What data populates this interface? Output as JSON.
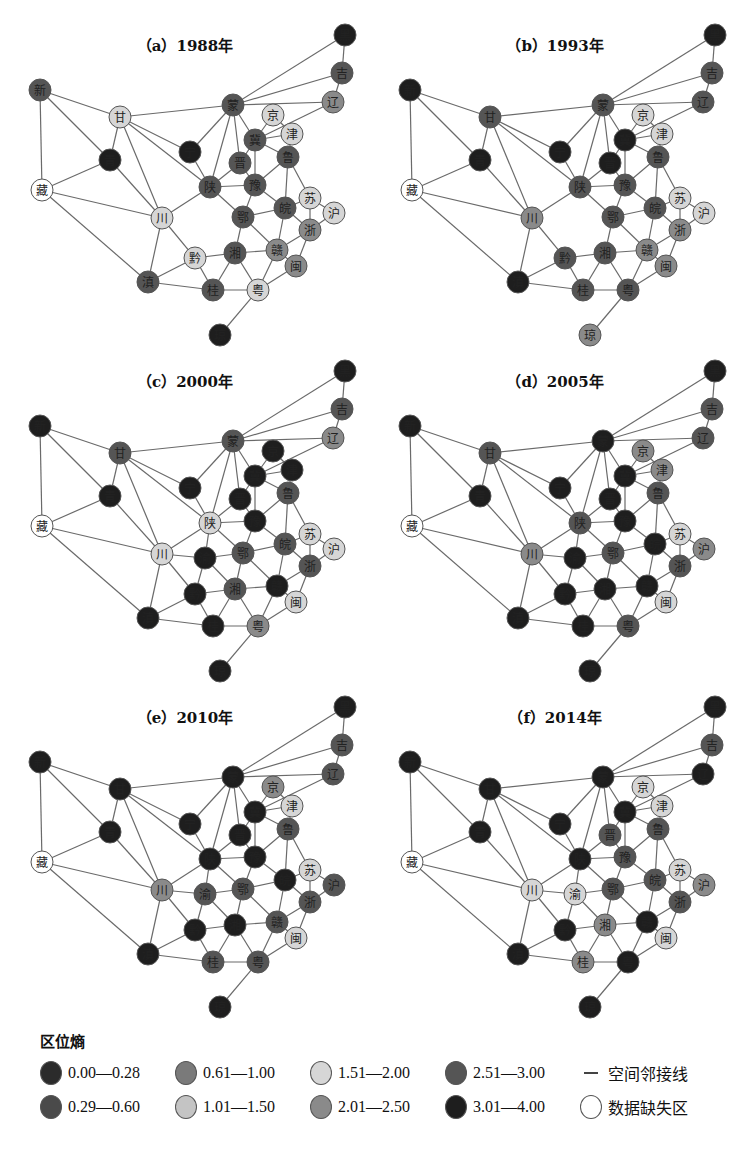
{
  "figure": {
    "panels": [
      {
        "id": "a",
        "title": "（a）1988年",
        "dx": 0,
        "dy": 0
      },
      {
        "id": "b",
        "title": "（b）1993年",
        "dx": 370,
        "dy": 0
      },
      {
        "id": "c",
        "title": "（c）2000年",
        "dx": 0,
        "dy": 336
      },
      {
        "id": "d",
        "title": "（d）2005年",
        "dx": 370,
        "dy": 336
      },
      {
        "id": "e",
        "title": "（e）2010年",
        "dx": 0,
        "dy": 672
      },
      {
        "id": "f",
        "title": "（f）2014年",
        "dx": 370,
        "dy": 672
      }
    ]
  },
  "chart_data": {
    "type": "network-small-multiples",
    "legend_title": "区位熵",
    "classes": [
      {
        "key": "c1",
        "label": "0.00—0.28",
        "color": "#2b2b2b"
      },
      {
        "key": "c2",
        "label": "0.29—0.60",
        "color": "#4a4a4a"
      },
      {
        "key": "c3",
        "label": "0.61—1.00",
        "color": "#7a7a7a"
      },
      {
        "key": "c4",
        "label": "1.01—1.50",
        "color": "#c4c4c4"
      },
      {
        "key": "c5",
        "label": "1.51—2.00",
        "color": "#d6d6d6"
      },
      {
        "key": "c6",
        "label": "2.01—2.50",
        "color": "#8a8a8a"
      },
      {
        "key": "c7",
        "label": "2.51—3.00",
        "color": "#555555"
      },
      {
        "key": "c8",
        "label": "3.01—4.00",
        "color": "#1e1e1e"
      },
      {
        "key": "na",
        "label": "数据缺失区",
        "color": "#ffffff"
      }
    ],
    "edge_legend": "空间邻接线",
    "nodes": {
      "黑": [
        345,
        35
      ],
      "吉": [
        342,
        73
      ],
      "辽": [
        333,
        102
      ],
      "新": [
        40,
        90
      ],
      "甘": [
        120,
        117
      ],
      "青": [
        110,
        160
      ],
      "藏": [
        42,
        190
      ],
      "川": [
        162,
        218
      ],
      "渝": [
        205,
        222
      ],
      "宁": [
        190,
        152
      ],
      "蒙": [
        233,
        105
      ],
      "京": [
        273,
        115
      ],
      "津": [
        292,
        134
      ],
      "冀": [
        255,
        140
      ],
      "晋": [
        240,
        163
      ],
      "鲁": [
        288,
        157
      ],
      "陕": [
        210,
        187
      ],
      "豫": [
        255,
        185
      ],
      "皖": [
        285,
        208
      ],
      "苏": [
        310,
        198
      ],
      "沪": [
        334,
        213
      ],
      "浙": [
        310,
        230
      ],
      "鄂": [
        243,
        217
      ],
      "赣": [
        277,
        250
      ],
      "闽": [
        296,
        266
      ],
      "湘": [
        235,
        253
      ],
      "黔": [
        195,
        258
      ],
      "滇": [
        148,
        282
      ],
      "桂": [
        213,
        290
      ],
      "粤": [
        258,
        290
      ],
      "琼": [
        220,
        335
      ]
    },
    "edges": [
      [
        "黑",
        "吉"
      ],
      [
        "黑",
        "蒙"
      ],
      [
        "吉",
        "蒙"
      ],
      [
        "吉",
        "辽"
      ],
      [
        "辽",
        "蒙"
      ],
      [
        "辽",
        "冀"
      ],
      [
        "新",
        "甘"
      ],
      [
        "新",
        "青"
      ],
      [
        "新",
        "藏"
      ],
      [
        "甘",
        "蒙"
      ],
      [
        "甘",
        "青"
      ],
      [
        "甘",
        "宁"
      ],
      [
        "甘",
        "陕"
      ],
      [
        "甘",
        "川"
      ],
      [
        "青",
        "藏"
      ],
      [
        "青",
        "川"
      ],
      [
        "藏",
        "川"
      ],
      [
        "藏",
        "滇"
      ],
      [
        "蒙",
        "宁"
      ],
      [
        "蒙",
        "陕"
      ],
      [
        "蒙",
        "晋"
      ],
      [
        "蒙",
        "冀"
      ],
      [
        "宁",
        "陕"
      ],
      [
        "京",
        "冀"
      ],
      [
        "京",
        "津"
      ],
      [
        "津",
        "冀"
      ],
      [
        "津",
        "鲁"
      ],
      [
        "冀",
        "晋"
      ],
      [
        "冀",
        "鲁"
      ],
      [
        "冀",
        "豫"
      ],
      [
        "晋",
        "陕"
      ],
      [
        "晋",
        "豫"
      ],
      [
        "鲁",
        "豫"
      ],
      [
        "鲁",
        "皖"
      ],
      [
        "鲁",
        "苏"
      ],
      [
        "陕",
        "豫"
      ],
      [
        "陕",
        "鄂"
      ],
      [
        "陕",
        "川"
      ],
      [
        "陕",
        "渝"
      ],
      [
        "豫",
        "鄂"
      ],
      [
        "豫",
        "皖"
      ],
      [
        "皖",
        "苏"
      ],
      [
        "皖",
        "浙"
      ],
      [
        "皖",
        "赣"
      ],
      [
        "皖",
        "鄂"
      ],
      [
        "苏",
        "浙"
      ],
      [
        "苏",
        "沪"
      ],
      [
        "沪",
        "浙"
      ],
      [
        "浙",
        "赣"
      ],
      [
        "浙",
        "闽"
      ],
      [
        "鄂",
        "湘"
      ],
      [
        "鄂",
        "赣"
      ],
      [
        "鄂",
        "渝"
      ],
      [
        "川",
        "渝"
      ],
      [
        "川",
        "黔"
      ],
      [
        "川",
        "滇"
      ],
      [
        "渝",
        "黔"
      ],
      [
        "渝",
        "湘"
      ],
      [
        "赣",
        "湘"
      ],
      [
        "赣",
        "闽"
      ],
      [
        "赣",
        "粤"
      ],
      [
        "闽",
        "粤"
      ],
      [
        "湘",
        "黔"
      ],
      [
        "湘",
        "桂"
      ],
      [
        "湘",
        "粤"
      ],
      [
        "黔",
        "滇"
      ],
      [
        "黔",
        "桂"
      ],
      [
        "滇",
        "桂"
      ],
      [
        "桂",
        "粤"
      ],
      [
        "粤",
        "琼"
      ]
    ],
    "years": {
      "1988": {
        "黑": "c8",
        "吉": "c7",
        "辽": "c6",
        "新": "c7",
        "甘": "c5",
        "青": "c8",
        "藏": "na",
        "川": "c5",
        "宁": "c8",
        "蒙": "c7",
        "京": "c5",
        "津": "c5",
        "冀": "c7",
        "晋": "c7",
        "鲁": "c7",
        "陕": "c7",
        "豫": "c7",
        "皖": "c7",
        "苏": "c5",
        "沪": "c5",
        "浙": "c6",
        "鄂": "c7",
        "赣": "c6",
        "闽": "c6",
        "湘": "c7",
        "黔": "c5",
        "滇": "c7",
        "桂": "c7",
        "粤": "c5",
        "琼": "c8"
      },
      "1993": {
        "黑": "c8",
        "吉": "c7",
        "辽": "c7",
        "新": "c8",
        "甘": "c7",
        "青": "c8",
        "藏": "na",
        "川": "c6",
        "宁": "c8",
        "蒙": "c7",
        "京": "c5",
        "津": "c5",
        "冀": "c8",
        "晋": "c8",
        "鲁": "c7",
        "陕": "c7",
        "豫": "c7",
        "皖": "c7",
        "苏": "c5",
        "沪": "c5",
        "浙": "c6",
        "鄂": "c7",
        "赣": "c6",
        "闽": "c6",
        "湘": "c7",
        "黔": "c7",
        "滇": "c8",
        "桂": "c7",
        "粤": "c7",
        "琼": "c6"
      },
      "2000": {
        "黑": "c8",
        "吉": "c7",
        "辽": "c6",
        "新": "c8",
        "甘": "c7",
        "青": "c8",
        "藏": "na",
        "川": "c5",
        "渝": "c8",
        "宁": "c8",
        "蒙": "c7",
        "京": "c8",
        "津": "c8",
        "冀": "c8",
        "晋": "c8",
        "鲁": "c7",
        "陕": "c5",
        "豫": "c8",
        "皖": "c7",
        "苏": "c5",
        "沪": "c5",
        "浙": "c7",
        "鄂": "c7",
        "赣": "c8",
        "闽": "c5",
        "湘": "c7",
        "黔": "c8",
        "滇": "c8",
        "桂": "c8",
        "粤": "c6",
        "琼": "c8"
      },
      "2005": {
        "黑": "c8",
        "吉": "c7",
        "辽": "c7",
        "新": "c8",
        "甘": "c7",
        "青": "c8",
        "藏": "na",
        "川": "c6",
        "渝": "c8",
        "宁": "c8",
        "蒙": "c8",
        "京": "c6",
        "津": "c6",
        "冀": "c8",
        "晋": "c8",
        "鲁": "c7",
        "陕": "c7",
        "豫": "c8",
        "皖": "c8",
        "苏": "c5",
        "沪": "c6",
        "浙": "c7",
        "鄂": "c7",
        "赣": "c8",
        "闽": "c5",
        "湘": "c8",
        "黔": "c8",
        "滇": "c8",
        "桂": "c8",
        "粤": "c7",
        "琼": "c8"
      },
      "2010": {
        "黑": "c8",
        "吉": "c7",
        "辽": "c7",
        "新": "c8",
        "甘": "c8",
        "青": "c8",
        "藏": "na",
        "川": "c6",
        "渝": "c7",
        "宁": "c8",
        "蒙": "c8",
        "京": "c6",
        "津": "c5",
        "冀": "c8",
        "晋": "c8",
        "鲁": "c7",
        "陕": "c8",
        "豫": "c8",
        "皖": "c8",
        "苏": "c5",
        "沪": "c7",
        "浙": "c7",
        "鄂": "c7",
        "赣": "c7",
        "闽": "c5",
        "湘": "c8",
        "黔": "c8",
        "滇": "c8",
        "桂": "c7",
        "粤": "c7",
        "琼": "c8"
      },
      "2014": {
        "黑": "c8",
        "吉": "c7",
        "辽": "c8",
        "新": "c8",
        "甘": "c8",
        "青": "c8",
        "藏": "na",
        "川": "c5",
        "渝": "c5",
        "宁": "c8",
        "蒙": "c8",
        "京": "c5",
        "津": "c5",
        "冀": "c8",
        "晋": "c7",
        "鲁": "c7",
        "陕": "c8",
        "豫": "c7",
        "皖": "c7",
        "苏": "c5",
        "沪": "c6",
        "浙": "c7",
        "鄂": "c7",
        "赣": "c8",
        "闽": "c5",
        "湘": "c6",
        "黔": "c8",
        "滇": "c8",
        "桂": "c6",
        "粤": "c8",
        "琼": "c8"
      }
    }
  },
  "legend": {
    "title": "区位熵",
    "rows": [
      [
        {
          "key": "c1",
          "label": "0.00—0.28"
        },
        {
          "key": "c3",
          "label": "0.61—1.00"
        },
        {
          "key": "c5",
          "label": "1.51—2.00"
        },
        {
          "key": "c7",
          "label": "2.51—3.00"
        },
        {
          "key": "line",
          "label": "空间邻接线"
        }
      ],
      [
        {
          "key": "c2",
          "label": "0.29—0.60"
        },
        {
          "key": "c4",
          "label": "1.01—1.50"
        },
        {
          "key": "c6",
          "label": "2.01—2.50"
        },
        {
          "key": "c8",
          "label": "3.01—4.00"
        },
        {
          "key": "na",
          "label": "数据缺失区"
        }
      ]
    ]
  }
}
